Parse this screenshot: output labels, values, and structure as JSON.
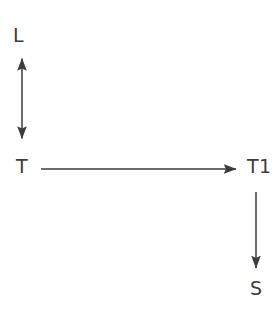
{
  "diagram": {
    "background_color": "#ffffff",
    "stroke_color": "#3c3c3c",
    "text_color": "#3c3c3c",
    "nodes": [
      {
        "id": "L",
        "label": "L",
        "x": 22,
        "y": 36
      },
      {
        "id": "T",
        "label": "T",
        "x": 22,
        "y": 167
      },
      {
        "id": "T1",
        "label": "T1",
        "x": 256,
        "y": 167
      },
      {
        "id": "S",
        "label": "S",
        "x": 256,
        "y": 289
      }
    ],
    "edges": [
      {
        "id": "edge-L-T",
        "from": "L",
        "to": "T",
        "orientation": "vertical",
        "arrowheads": "both",
        "label": "",
        "x1": 22,
        "y1": 57,
        "x2": 22,
        "y2": 140
      },
      {
        "id": "edge-T-T1",
        "from": "T",
        "to": "T1",
        "orientation": "horizontal",
        "arrowheads": "end",
        "label": "",
        "x1": 41,
        "y1": 169,
        "x2": 238,
        "y2": 169
      },
      {
        "id": "edge-T1-S",
        "from": "T1",
        "to": "S",
        "orientation": "vertical",
        "arrowheads": "end",
        "label": "",
        "x1": 256,
        "y1": 192,
        "x2": 256,
        "y2": 270
      }
    ]
  }
}
